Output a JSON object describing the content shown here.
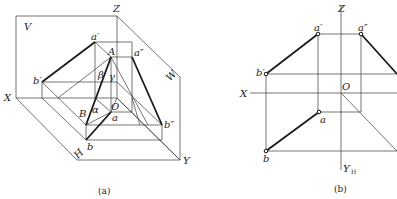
{
  "figure_a": {
    "caption": "(a)",
    "labels": {
      "V": "V",
      "Z": "Z",
      "X": "X",
      "H": "H",
      "W": "W",
      "Y": "Y",
      "O": "O",
      "a_prime": "a′",
      "b_prime": "b′",
      "A": "A",
      "a_dprime": "a″",
      "b_dprime": "b″",
      "B": "B",
      "b": "b",
      "a": "a",
      "beta": "β",
      "gamma": "γ",
      "alpha1": "α",
      "alpha2": "α"
    }
  },
  "figure_b": {
    "caption": "(b)",
    "labels": {
      "Z": "Z",
      "X": "X",
      "O": "O",
      "Y_H": "Y",
      "Y_H_sub": "H",
      "a_prime": "a′",
      "a_dprime": "a″",
      "b_prime": "b′",
      "a": "a",
      "b": "b"
    }
  }
}
